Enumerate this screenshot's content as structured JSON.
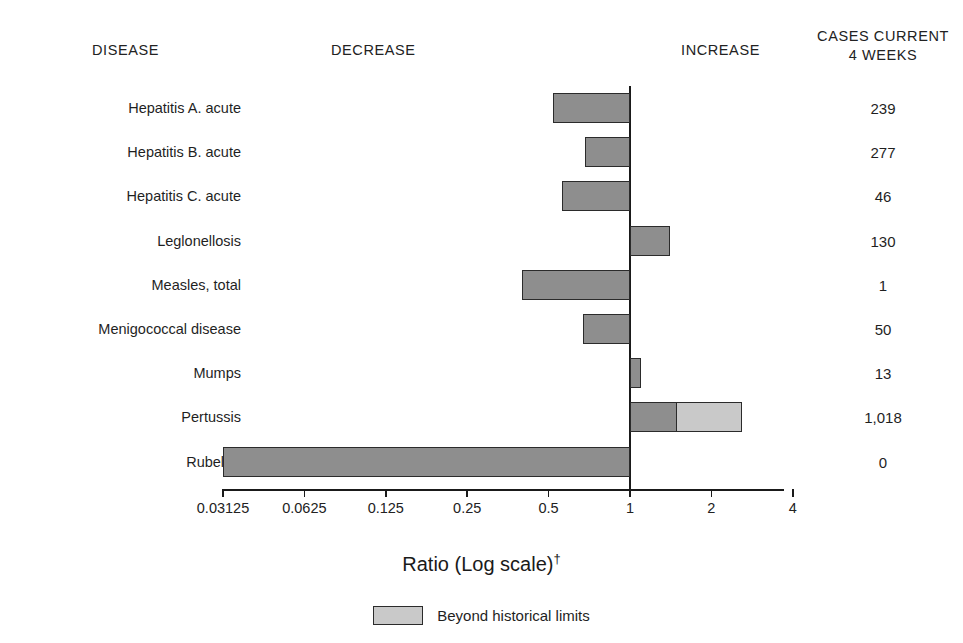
{
  "headers": {
    "disease": "DISEASE",
    "decrease": "DECREASE",
    "increase": "INCREASE",
    "cases_line1": "CASES CURRENT",
    "cases_line2": "4 WEEKS"
  },
  "axis_title": "Ratio (Log scale)",
  "axis_title_marker": "†",
  "legend": {
    "swatch_color": "#c9c9c9",
    "label": "Beyond historical limits"
  },
  "colors": {
    "bar_main": "#8e8e8e",
    "bar_beyond": "#c9c9c9",
    "bar_border": "#2b2b2b",
    "axis": "#1a1a1a",
    "text": "#1f1f1f",
    "background": "#ffffff"
  },
  "chart_data": {
    "type": "bar",
    "orientation": "horizontal",
    "title": "",
    "xlabel": "Ratio (Log scale)†",
    "ylabel": "",
    "scale": "log2",
    "xlim": [
      0.03125,
      4
    ],
    "reference_line": 1,
    "grid": false,
    "legend_position": "bottom-center",
    "tick_labels": [
      "0.03125",
      "0.0625",
      "0.125",
      "0.25",
      "0.5",
      "1",
      "2",
      "4"
    ],
    "tick_values": [
      0.03125,
      0.0625,
      0.125,
      0.25,
      0.5,
      1,
      2,
      4
    ],
    "categories": [
      "Hepatitis A. acute",
      "Hepatitis B. acute",
      "Hepatitis C. acute",
      "Leglonellosis",
      "Measles, total",
      "Menigococcal disease",
      "Mumps",
      "Pertussis",
      "Rubella*"
    ],
    "series": [
      {
        "name": "Ratio",
        "values": [
          0.52,
          0.68,
          0.56,
          1.4,
          0.4,
          0.67,
          1.1,
          1.5,
          0.03125
        ]
      },
      {
        "name": "Beyond historical limits",
        "values": [
          null,
          null,
          null,
          null,
          null,
          null,
          null,
          2.6,
          null
        ]
      }
    ],
    "cases_current_4_weeks": [
      "239",
      "277",
      "46",
      "130",
      "1",
      "50",
      "13",
      "1,018",
      "0"
    ]
  },
  "rows": [
    {
      "label": "Hepatitis A. acute",
      "count": "239",
      "ratio": 0.52,
      "beyond_to": null,
      "direction": "decrease"
    },
    {
      "label": "Hepatitis B. acute",
      "count": "277",
      "ratio": 0.68,
      "beyond_to": null,
      "direction": "decrease"
    },
    {
      "label": "Hepatitis C. acute",
      "count": "46",
      "ratio": 0.56,
      "beyond_to": null,
      "direction": "decrease"
    },
    {
      "label": "Leglonellosis",
      "count": "130",
      "ratio": 1.4,
      "beyond_to": null,
      "direction": "increase"
    },
    {
      "label": "Measles, total",
      "count": "1",
      "ratio": 0.4,
      "beyond_to": null,
      "direction": "decrease"
    },
    {
      "label": "Menigococcal disease",
      "count": "50",
      "ratio": 0.67,
      "beyond_to": null,
      "direction": "decrease"
    },
    {
      "label": "Mumps",
      "count": "13",
      "ratio": 1.1,
      "beyond_to": null,
      "direction": "increase"
    },
    {
      "label": "Pertussis",
      "count": "1,018",
      "ratio": 1.5,
      "beyond_to": 2.6,
      "direction": "increase"
    },
    {
      "label": "Rubella*",
      "count": "0",
      "ratio": 0.03125,
      "beyond_to": null,
      "direction": "decrease"
    }
  ]
}
